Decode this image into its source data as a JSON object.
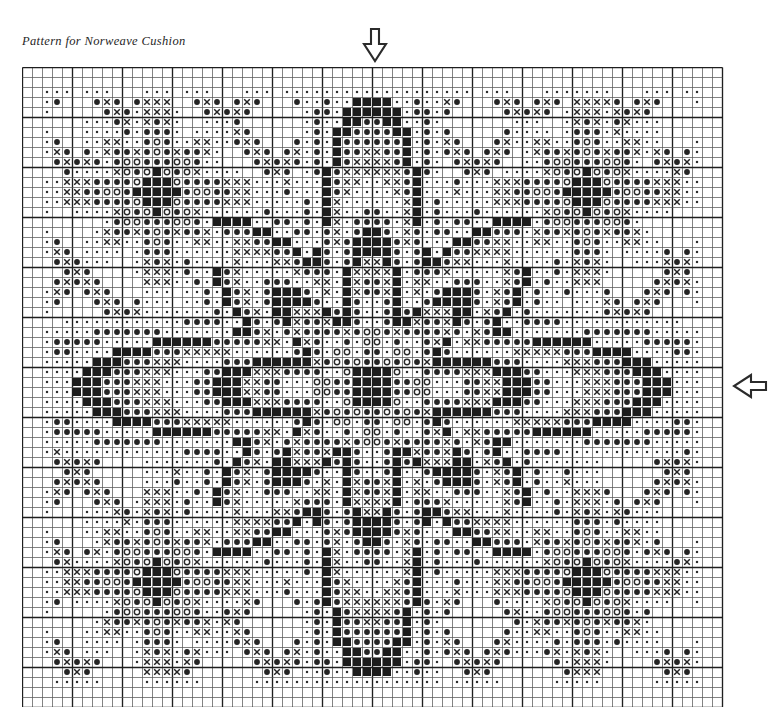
{
  "title": "Pattern for Norweave Cushion",
  "document_type": "cross-stitch pattern chart",
  "grid": {
    "columns": 70,
    "rows": 64,
    "cell_size_px": 10,
    "left_px": 22,
    "top_px": 67,
    "minor_line_color": "#5a5a5a",
    "major_line_color": "#1e1e1e",
    "major_line_every": 5,
    "background_color": "#ffffff"
  },
  "symbol_legend": [
    {
      "key": "dot",
      "name": "small-dot",
      "glyph": "·",
      "description": "small filled dot — background stitch"
    },
    {
      "key": "circle",
      "name": "open-circle",
      "glyph": "○",
      "description": "open circle — light accent stitch"
    },
    {
      "key": "disc",
      "name": "filled-circle",
      "glyph": "●",
      "description": "filled circle — medium tone stitch"
    },
    {
      "key": "cross",
      "name": "cross-x",
      "glyph": "×",
      "description": "X cross — contrast stitch"
    },
    {
      "key": "block",
      "name": "filled-square",
      "glyph": "■",
      "description": "solid filled square — darkest stitch"
    }
  ],
  "markers": [
    {
      "name": "top-center-arrow",
      "direction": "down",
      "points_to": "centre column of chart",
      "x_px": 361,
      "y_px": 27
    },
    {
      "name": "right-center-arrow",
      "direction": "left",
      "points_to": "centre row of chart",
      "x_px": 732,
      "y_px": 372
    }
  ],
  "chart_data": {
    "type": "heatmap",
    "title": "Pattern for Norweave Cushion",
    "xlabel": "",
    "ylabel": "",
    "columns": 70,
    "rows": 64,
    "legend_position": "none",
    "grid": true,
    "palette": {
      "empty": "#ffffff",
      "dot": "#303030",
      "circle": "#2a2a2a",
      "disc": "#242424",
      "cross": "#232323",
      "block": "#1c1c1c"
    },
    "symbol_codes": [
      ".",
      "o",
      "*",
      "x",
      "#"
    ],
    "note": "Symmetric Norwegian star/diamond cushion motif. Generated from the radial + diagonal motif field encoded in motif_spec; both axes mirror about the centre marked by the two arrows.",
    "motif_spec": {
      "center_col": 34.5,
      "center_row": 31.5,
      "mirror_x": true,
      "mirror_y": true,
      "star_points": 8,
      "bands": [
        {
          "r0": 0.0,
          "r1": 2.2,
          "sym": "#"
        },
        {
          "r0": 2.2,
          "r1": 3.4,
          "sym": "*"
        },
        {
          "r0": 3.4,
          "r1": 4.6,
          "sym": "o"
        },
        {
          "r0": 4.6,
          "r1": 6.2,
          "sym": "."
        },
        {
          "r0": 6.2,
          "r1": 8.0,
          "sym": "*"
        },
        {
          "r0": 8.0,
          "r1": 9.6,
          "sym": "x"
        },
        {
          "r0": 9.6,
          "r1": 11.4,
          "sym": "#"
        },
        {
          "r0": 11.4,
          "r1": 13.0,
          "sym": "*"
        },
        {
          "r0": 13.0,
          "r1": 15.0,
          "sym": "."
        },
        {
          "r0": 15.0,
          "r1": 17.0,
          "sym": "x"
        },
        {
          "r0": 17.0,
          "r1": 19.0,
          "sym": "*"
        },
        {
          "r0": 19.0,
          "r1": 21.0,
          "sym": "#"
        },
        {
          "r0": 21.0,
          "r1": 23.5,
          "sym": "."
        },
        {
          "r0": 23.5,
          "r1": 26.0,
          "sym": "*"
        },
        {
          "r0": 26.0,
          "r1": 30.0,
          "sym": "."
        }
      ],
      "corner_stars": [
        {
          "col": 13,
          "row": 12,
          "radius": 9
        },
        {
          "col": 56,
          "row": 12,
          "radius": 9
        },
        {
          "col": 13,
          "row": 51,
          "radius": 9
        },
        {
          "col": 56,
          "row": 51,
          "radius": 9
        }
      ],
      "edge_margin": 2
    }
  }
}
